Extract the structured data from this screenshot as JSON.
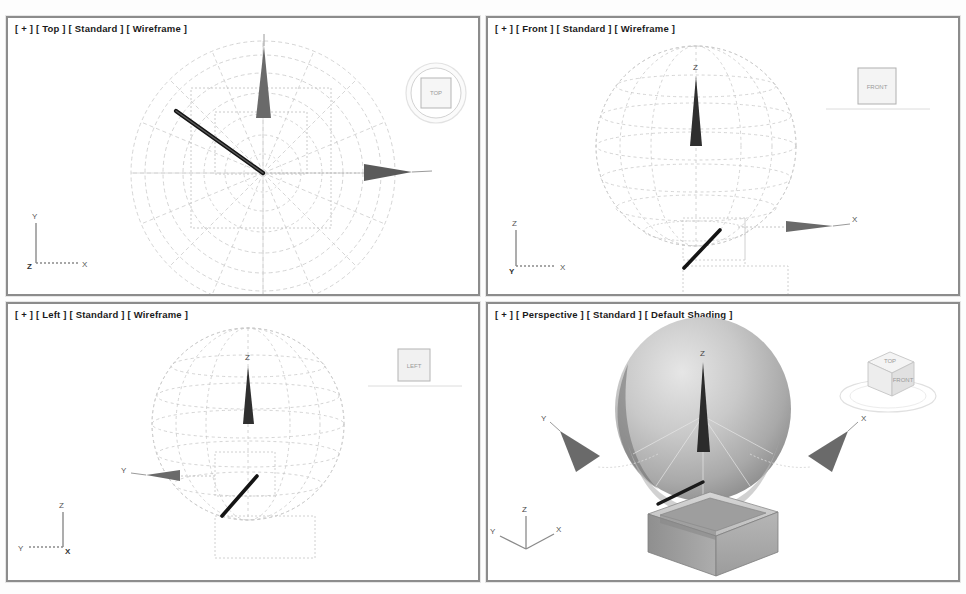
{
  "page": {
    "top_caption": "",
    "bottom_caption": ""
  },
  "viewports": [
    {
      "id": "top",
      "label": "[ + ] [ Top ] [ Standard ] [ Wireframe ]",
      "label_parts": [
        "+",
        "Top",
        "Standard",
        "Wireframe"
      ],
      "projection": "Top",
      "shading": "Wireframe",
      "lighting": "Standard",
      "viewcube": {
        "face_label": "TOP",
        "style": "circle-with-square"
      },
      "axis_tripod": {
        "up": "Y",
        "right": "X",
        "origin": "Z"
      },
      "objects": [
        "sphere-wireframe-top",
        "box-outline",
        "rod-line",
        "arrow-gizmo-x",
        "arrow-gizmo-y"
      ]
    },
    {
      "id": "front",
      "label": "[ + ] [ Front ] [ Standard ] [ Wireframe ]",
      "label_parts": [
        "+",
        "Front",
        "Standard",
        "Wireframe"
      ],
      "projection": "Front",
      "shading": "Wireframe",
      "lighting": "Standard",
      "viewcube": {
        "face_label": "FRONT",
        "style": "square-with-ground-line"
      },
      "axis_tripod": {
        "up": "Z",
        "right": "X",
        "origin": "Y"
      },
      "objects": [
        "sphere-wireframe",
        "box-outline",
        "rod-line",
        "arrow-gizmo-x",
        "arrow-gizmo-z"
      ]
    },
    {
      "id": "left",
      "label": "[ + ] [ Left ] [ Standard ] [ Wireframe ]",
      "label_parts": [
        "+",
        "Left",
        "Standard",
        "Wireframe"
      ],
      "projection": "Left",
      "shading": "Wireframe",
      "lighting": "Standard",
      "viewcube": {
        "face_label": "LEFT",
        "style": "square-with-ground-line"
      },
      "axis_tripod": {
        "up": "Z",
        "right": "X",
        "origin": "Y"
      },
      "objects": [
        "sphere-wireframe",
        "box-outline",
        "rod-line",
        "arrow-gizmo-y",
        "arrow-gizmo-z"
      ]
    },
    {
      "id": "perspective",
      "label": "[ + ] [ Perspective ] [ Standard ] [ Default Shading ]",
      "label_parts": [
        "+",
        "Perspective",
        "Standard",
        "Default Shading"
      ],
      "projection": "Perspective",
      "shading": "Default Shading",
      "lighting": "Standard",
      "viewcube": {
        "face_label": "TOP",
        "side_label": "FRONT",
        "style": "3d-cube-with-ring"
      },
      "axis_tripod": {
        "up": "Z",
        "left": "Y",
        "right": "X"
      },
      "objects": [
        "sphere-shaded",
        "box-shaded-open",
        "rod-line",
        "arrow-gizmo-x",
        "arrow-gizmo-y",
        "arrow-gizmo-z"
      ]
    }
  ],
  "axis_letters": {
    "x": "X",
    "y": "Y",
    "z": "Z"
  },
  "colors": {
    "viewport_border": "#8c8c8c",
    "viewport_background": "#ffffff",
    "wireframe": "#c9c9c9",
    "wireframe_dark": "#a8a8a8",
    "gizmo_dark": "#3a3a3a",
    "rod": "#111111",
    "shaded_light": "#d8d8d8",
    "shaded_mid": "#b4b4b4",
    "shaded_dark": "#7e7e7e",
    "label_text": "#1a1a1a",
    "viewcube_text": "#9a9a9a"
  }
}
